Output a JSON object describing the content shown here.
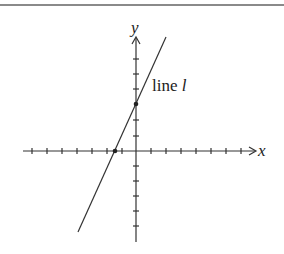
{
  "diagram": {
    "type": "coordinate-plane",
    "axes": {
      "x_label": "x",
      "y_label": "y",
      "tick_count_left": 7,
      "tick_count_right": 7,
      "tick_count_up": 4,
      "tick_count_down": 5
    },
    "line": {
      "label_prefix": "line ",
      "label_name": "l",
      "y_intercept_ticks": 3,
      "x_intercept_ticks": -1.5
    },
    "colors": {
      "stroke": "#333333",
      "rule": "#8a8a8a",
      "background": "#ffffff"
    }
  }
}
